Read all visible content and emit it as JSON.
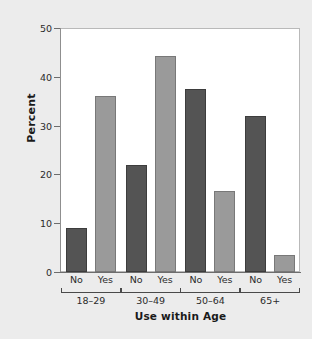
{
  "chart_data": {
    "type": "bar",
    "title": "",
    "xlabel": "Use within Age",
    "ylabel": "Percent",
    "ylim": [
      0,
      50
    ],
    "yticks": [
      0,
      10,
      20,
      30,
      40,
      50
    ],
    "grid": false,
    "legend": "none",
    "categories": [
      "No",
      "Yes",
      "No",
      "Yes",
      "No",
      "Yes",
      "No",
      "Yes"
    ],
    "groups": [
      "18–29",
      "30–49",
      "50–64",
      "65+"
    ],
    "values": [
      9.0,
      36.0,
      22.0,
      44.2,
      37.6,
      16.7,
      32.0,
      3.5
    ],
    "bars": [
      {
        "group": "18–29",
        "use": "No",
        "value": 9.0,
        "color": "#545454"
      },
      {
        "group": "18–29",
        "use": "Yes",
        "value": 36.0,
        "color": "#9a9a9a"
      },
      {
        "group": "30–49",
        "use": "No",
        "value": 22.0,
        "color": "#545454"
      },
      {
        "group": "30–49",
        "use": "Yes",
        "value": 44.2,
        "color": "#9a9a9a"
      },
      {
        "group": "50–64",
        "use": "No",
        "value": 37.6,
        "color": "#545454"
      },
      {
        "group": "50–64",
        "use": "Yes",
        "value": 16.7,
        "color": "#9a9a9a"
      },
      {
        "group": "65+",
        "use": "No",
        "value": 32.0,
        "color": "#545454"
      },
      {
        "group": "65+",
        "use": "Yes",
        "value": 3.5,
        "color": "#9a9a9a"
      }
    ]
  },
  "colors": {
    "figure_background": "#ececec",
    "plot_background": "#ffffff",
    "bar_no": "#545454",
    "bar_yes": "#9a9a9a",
    "axis": "#6d6d6d",
    "text": "#2b2b2b"
  }
}
